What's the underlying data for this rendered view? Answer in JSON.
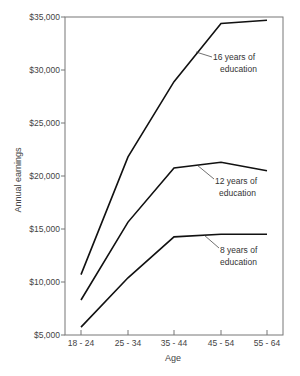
{
  "chart_data": {
    "type": "line",
    "title": "",
    "xlabel": "Age",
    "ylabel": "Annual earnings",
    "categories": [
      "18 - 24",
      "25 - 34",
      "35 - 44",
      "45 - 54",
      "55 - 64"
    ],
    "ylim": [
      5000,
      35000
    ],
    "yticks": [
      5000,
      10000,
      15000,
      20000,
      25000,
      30000,
      35000
    ],
    "ytick_labels": [
      "$5,000",
      "$10,000",
      "$15,000",
      "$20,000",
      "$25,000",
      "$30,000",
      "$35,000"
    ],
    "grid": false,
    "legend": "inline annotations",
    "series": [
      {
        "name": "16 years of education",
        "label_line1": "16 years of",
        "label_line2": "education",
        "values": [
          10700,
          21800,
          28900,
          34400,
          34700
        ]
      },
      {
        "name": "12 years of education",
        "label_line1": "12 years of",
        "label_line2": "education",
        "values": [
          8300,
          15650,
          20750,
          21300,
          20500
        ]
      },
      {
        "name": "8 years of education",
        "label_line1": "8 years of",
        "label_line2": "education",
        "values": [
          5750,
          10400,
          14250,
          14500,
          14500
        ]
      }
    ]
  }
}
